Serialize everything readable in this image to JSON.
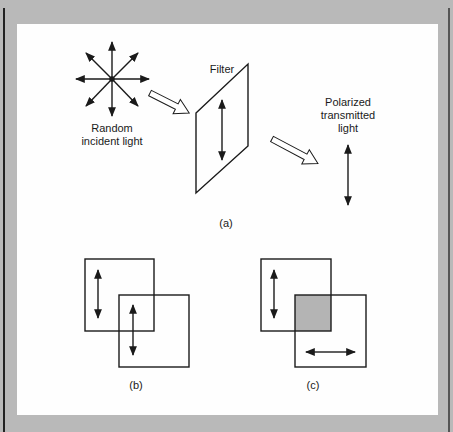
{
  "figure": {
    "panel_a": {
      "source_label": [
        "Random",
        "incident light"
      ],
      "filter_label": "Filter",
      "output_label": [
        "Polarized",
        "transmitted",
        "light"
      ],
      "caption": "(a)"
    },
    "panel_b": {
      "caption": "(b)",
      "description": "Two overlapping filters with parallel (vertical) polarization axes"
    },
    "panel_c": {
      "caption": "(c)",
      "description": "Two overlapping filters with crossed polarization axes; overlap shaded"
    },
    "colors": {
      "border": "#b9b9b9",
      "panel": "#fefefe",
      "ink": "#1a1a1a",
      "overlap_shade": "#b4b4b4"
    }
  }
}
